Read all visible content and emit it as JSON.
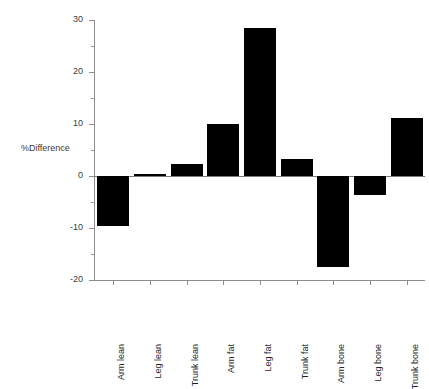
{
  "chart_data": {
    "type": "bar",
    "title": "",
    "subtitle": "",
    "xlabel": "",
    "ylabel": "%Difference",
    "categories": [
      "Arm lean",
      "Leg lean",
      "Trunk lean",
      "Arm fat",
      "Leg fat",
      "Trunk fat",
      "Arm bone",
      "Leg bone",
      "Trunk bone"
    ],
    "values": [
      -9.6,
      0.4,
      2.3,
      10.0,
      28.5,
      3.2,
      -17.5,
      -3.7,
      11.2
    ],
    "ylim": [
      -20,
      30
    ],
    "yticks": [
      30,
      20,
      10,
      0,
      -10,
      -20
    ],
    "ytick_labels": [
      "30",
      "20",
      "10",
      "0",
      "-10",
      "-20"
    ],
    "grid": false,
    "legend": null,
    "bar_color": "#000000",
    "axis_color": "#8d8d8d",
    "background": "#ffffff",
    "annotations": []
  }
}
